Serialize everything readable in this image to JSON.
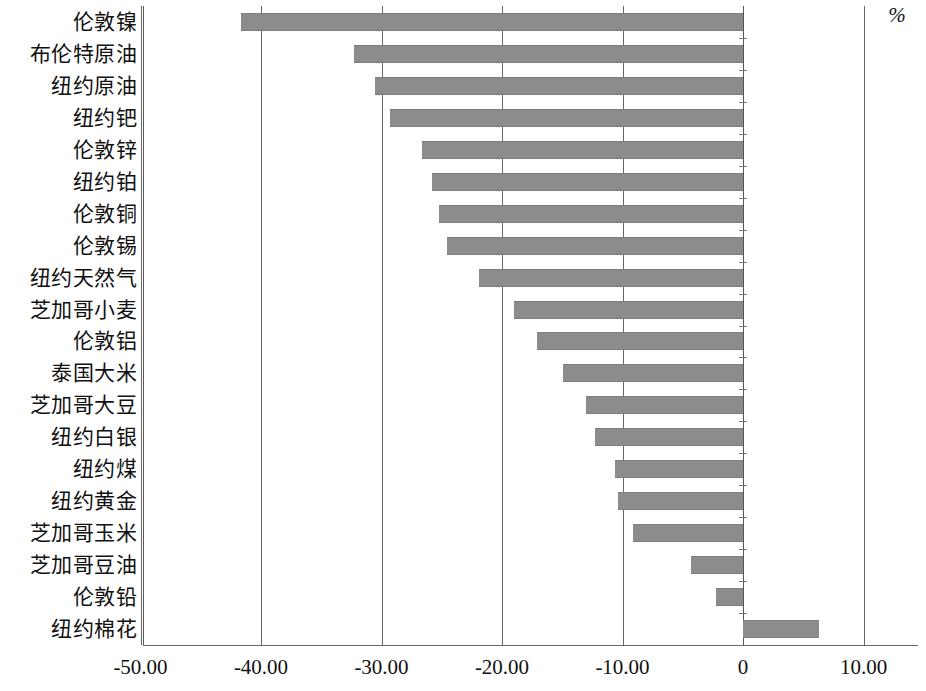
{
  "chart_data": {
    "type": "bar",
    "orientation": "horizontal",
    "title": "",
    "subtitle": "",
    "xlabel": "%",
    "ylabel": "",
    "xlim": [
      -55.0,
      14.5
    ],
    "grid": true,
    "legend": null,
    "bar_color": "#8c8c8c",
    "axis_color": "#666666",
    "xticks": [
      "-50.00",
      "-40.00",
      "-30.00",
      "-20.00",
      "-10.00",
      "0",
      "10.00"
    ],
    "xtick_values": [
      -50,
      -40,
      -30,
      -20,
      -10,
      0,
      10
    ],
    "categories": [
      "伦敦镍",
      "布伦特原油",
      "纽约原油",
      "纽约钯",
      "伦敦锌",
      "纽约铂",
      "伦敦铜",
      "伦敦锡",
      "纽约天然气",
      "芝加哥小麦",
      "伦敦铝",
      "泰国大米",
      "芝加哥大豆",
      "纽约白银",
      "纽约煤",
      "纽约黄金",
      "芝加哥玉米",
      "芝加哥豆油",
      "伦敦铅",
      "纽约棉花"
    ],
    "values": [
      -41.7,
      -32.3,
      -30.5,
      -29.3,
      -26.6,
      -25.8,
      -25.2,
      -24.6,
      -21.9,
      -19.0,
      -17.1,
      -14.9,
      -13.0,
      -12.3,
      -10.6,
      -10.4,
      -9.1,
      -4.3,
      -2.2,
      6.3
    ]
  }
}
